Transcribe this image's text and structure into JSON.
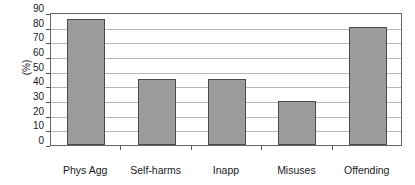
{
  "chart_data": {
    "type": "bar",
    "title": "",
    "subtitle": "",
    "xlabel": "",
    "ylabel": "(%)",
    "categories": [
      "Phys Agg",
      "Inapp\nsexualised",
      "Self-harms",
      "Misuses\nAlc/Drugs",
      "Offending"
    ],
    "category_order": [
      "Phys Agg",
      "Self-harms",
      "Inapp\nsexualised",
      "Misuses\nAlc/Drugs",
      "Offending"
    ],
    "values": [
      85,
      45,
      45,
      30,
      80
    ],
    "ylim": [
      0,
      90
    ],
    "ytick_step": 10,
    "yticks": [
      90,
      80,
      70,
      60,
      50,
      40,
      30,
      20,
      10,
      0
    ],
    "ytick_labels": [
      "90",
      "80",
      "70",
      "60",
      "50",
      "40",
      "30",
      "20",
      "10",
      "0"
    ],
    "grid": true,
    "grid_axis": "y",
    "legend": false,
    "legend_position": "none",
    "bars": [
      {
        "label": "Phys Agg",
        "label_lines": [
          "Phys Agg"
        ],
        "value": 85
      },
      {
        "label": "Self-harms",
        "label_lines": [
          "Self-harms"
        ],
        "value": 45
      },
      {
        "label": "Inapp sexualised",
        "label_lines": [
          "Inapp",
          "sexualised"
        ],
        "value": 45
      },
      {
        "label": "Misuses Alc/Drugs",
        "label_lines": [
          "Misuses",
          "Alc/Drugs"
        ],
        "value": 30
      },
      {
        "label": "Offending",
        "label_lines": [
          "Offending"
        ],
        "value": 80
      }
    ]
  },
  "style": {
    "bar_fill": "#9c9c9c",
    "bar_border": "#4a4a4a",
    "gridline_color": "#b8b8b8",
    "frame_color": "#666666",
    "background": "#ffffff",
    "text_color": "#1a1a1a"
  },
  "axis": {
    "y_title": "(%)",
    "tick_0": "0",
    "tick_10": "10",
    "tick_20": "20",
    "tick_30": "30",
    "tick_40": "40",
    "tick_50": "50",
    "tick_60": "60",
    "tick_70": "70",
    "tick_80": "80",
    "tick_90": "90"
  },
  "labels": {
    "cat_0_line_0": "Phys Agg",
    "cat_1_line_0": "Self-harms",
    "cat_2_line_0": "Inapp",
    "cat_2_line_1": "sexualised",
    "cat_3_line_0": "Misuses",
    "cat_3_line_1": "Alc/Drugs",
    "cat_4_line_0": "Offending"
  }
}
